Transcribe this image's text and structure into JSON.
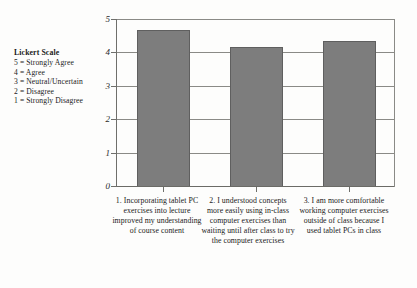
{
  "legend": {
    "title": "Lickert Scale",
    "lines": [
      "5 = Strongly Agree",
      "4 = Agree",
      "3 = Neutral/Uncertain",
      "2 = Disagree",
      "1 = Strongly Disagree"
    ]
  },
  "axis": {
    "y_ticks": [
      "0",
      "1",
      "2",
      "3",
      "4",
      "5"
    ]
  },
  "chart_data": {
    "type": "bar",
    "title": "",
    "xlabel": "",
    "ylabel": "",
    "ylim": [
      0,
      5
    ],
    "grid": true,
    "legend_position": "left-outside",
    "categories": [
      "1. Incorporating tablet PC exercises into lecture improved my understanding of course content",
      "2. I understood concepts more easily using in-class computer exercises than waiting until after class to try the computer exercises",
      "3. I am more comfortable working computer exercises outside of class because I used tablet PCs in class"
    ],
    "values": [
      4.64,
      4.12,
      4.31
    ],
    "bar_color": "#7d7d7d",
    "series": [
      {
        "name": "Mean response",
        "values": [
          4.64,
          4.12,
          4.31
        ]
      }
    ],
    "annotations": [
      "Lickert Scale",
      "5 = Strongly Agree",
      "4 = Agree",
      "3 = Neutral/Uncertain",
      "2 = Disagree",
      "1 = Strongly Disagree"
    ]
  }
}
